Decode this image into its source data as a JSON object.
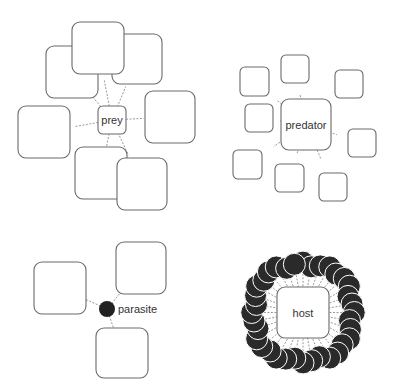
{
  "diagram": {
    "type": "interaction-types",
    "panels": [
      {
        "id": "prey",
        "label": "prey",
        "center_node": {
          "shape": "rounded-square",
          "x": 98,
          "y": 106,
          "w": 28,
          "h": 28
        },
        "neighbors": [
          {
            "x": 46,
            "y": 46,
            "w": 52,
            "h": 52
          },
          {
            "x": 112,
            "y": 34,
            "w": 50,
            "h": 50
          },
          {
            "x": 72,
            "y": 22,
            "w": 52,
            "h": 52
          },
          {
            "x": 145,
            "y": 91,
            "w": 50,
            "h": 52
          },
          {
            "x": 18,
            "y": 106,
            "w": 52,
            "h": 52
          },
          {
            "x": 75,
            "y": 147,
            "w": 52,
            "h": 52
          },
          {
            "x": 117,
            "y": 158,
            "w": 50,
            "h": 52
          }
        ]
      },
      {
        "id": "predator",
        "label": "predator",
        "center_node": {
          "shape": "rounded-square",
          "x": 281,
          "y": 99,
          "w": 50,
          "h": 51
        },
        "neighbors": [
          {
            "x": 240,
            "y": 67,
            "w": 29,
            "h": 29
          },
          {
            "x": 281,
            "y": 55,
            "w": 28,
            "h": 28
          },
          {
            "x": 335,
            "y": 70,
            "w": 28,
            "h": 28
          },
          {
            "x": 245,
            "y": 104,
            "w": 28,
            "h": 28
          },
          {
            "x": 348,
            "y": 129,
            "w": 28,
            "h": 28
          },
          {
            "x": 233,
            "y": 150,
            "w": 29,
            "h": 29
          },
          {
            "x": 275,
            "y": 164,
            "w": 29,
            "h": 28
          },
          {
            "x": 319,
            "y": 173,
            "w": 28,
            "h": 28
          }
        ]
      },
      {
        "id": "parasite",
        "label": "parasite",
        "center_node": {
          "shape": "circle",
          "cx": 107,
          "cy": 309,
          "r": 8
        },
        "neighbors": [
          {
            "x": 34,
            "y": 262,
            "w": 52,
            "h": 52
          },
          {
            "x": 116,
            "y": 242,
            "w": 50,
            "h": 52
          },
          {
            "x": 96,
            "y": 328,
            "w": 52,
            "h": 50
          }
        ]
      },
      {
        "id": "host",
        "label": "host",
        "center_node": {
          "shape": "rounded-square",
          "x": 277,
          "y": 287,
          "w": 52,
          "h": 51
        },
        "neighbor_shape": "filled-circle",
        "neighbor_count": 36
      }
    ]
  }
}
